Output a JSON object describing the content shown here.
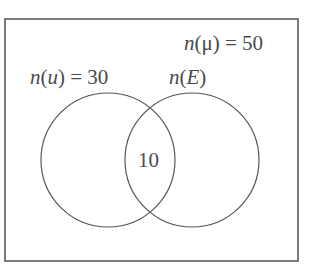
{
  "diagram": {
    "type": "venn",
    "universe": {
      "label_fn": "n",
      "label_set": "μ",
      "label_eq": "= 50",
      "value": 50
    },
    "sets": [
      {
        "id": "u",
        "label_fn": "n",
        "label_set": "u",
        "label_eq": "= 30",
        "value": 30
      },
      {
        "id": "E",
        "label_fn": "n",
        "label_set": "E",
        "label_eq": "",
        "value": null
      }
    ],
    "intersection": {
      "label": "10",
      "value": 10
    },
    "colors": {
      "stroke": "#555555",
      "text": "#4a4a4a",
      "background": "#ffffff"
    }
  }
}
